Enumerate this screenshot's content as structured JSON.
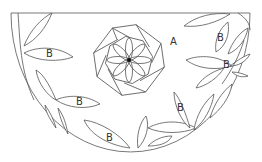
{
  "diagram": {
    "type": "geometric-design",
    "shape": "semicircle",
    "regions": {
      "A": {
        "label": "A",
        "description": "background region of semicircle"
      },
      "B": {
        "label": "B",
        "description": "leaf shapes along the arc"
      }
    },
    "labels": [
      {
        "id": "region-a",
        "text": "A",
        "x": 173,
        "y": 45
      },
      {
        "id": "leaf-b-1",
        "text": "B",
        "x": 49,
        "y": 57
      },
      {
        "id": "leaf-b-2",
        "text": "B",
        "x": 79,
        "y": 105
      },
      {
        "id": "leaf-b-3",
        "text": "B",
        "x": 109,
        "y": 141
      },
      {
        "id": "leaf-b-4",
        "text": "B",
        "x": 180,
        "y": 111
      },
      {
        "id": "leaf-b-5",
        "text": "B",
        "x": 220,
        "y": 41
      },
      {
        "id": "leaf-b-6",
        "text": "B",
        "x": 226,
        "y": 68
      }
    ],
    "center_figure": "octagon with eight-petal rosette",
    "stroke_color": "#555555",
    "background_color": "#ffffff"
  }
}
